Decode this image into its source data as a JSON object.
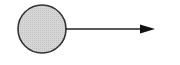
{
  "diagram": {
    "type": "vector",
    "node": {
      "shape": "circle",
      "fill": "#d4d4d4",
      "stroke": "#333333",
      "label": ""
    },
    "arrow": {
      "direction": "right",
      "color": "#222222",
      "label": ""
    }
  }
}
